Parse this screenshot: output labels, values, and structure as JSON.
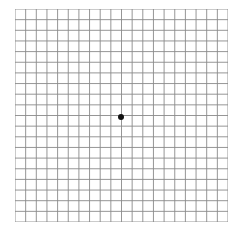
{
  "diagram": {
    "type": "amsler-grid",
    "rows": 20,
    "cols": 20,
    "line_color": "#8a8a8a",
    "background": "#ffffff",
    "center_dot_color": "#111111"
  }
}
